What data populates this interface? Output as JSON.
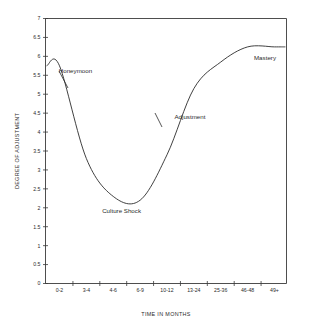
{
  "chart_data": {
    "type": "line",
    "title": "",
    "subtitle": "",
    "xlabel": "TIME IN MONTHS",
    "ylabel": "DEGREE OF ADJUSTMENT",
    "categories": [
      "0-2",
      "3-4",
      "4-6",
      "6-9",
      "10-12",
      "13-24",
      "25-36",
      "46-48",
      "49+"
    ],
    "x": [
      0,
      1,
      2,
      3,
      4,
      5,
      6,
      7,
      8
    ],
    "values": [
      5.75,
      3.3,
      2.3,
      2.2,
      3.4,
      5.15,
      5.85,
      6.25,
      6.25
    ],
    "series": [
      {
        "name": "Degree of Adjustment",
        "values": [
          5.75,
          3.3,
          2.3,
          2.2,
          3.4,
          5.15,
          5.85,
          6.25,
          6.25
        ]
      }
    ],
    "ylim": [
      0,
      7
    ],
    "ytick_step": 0.5,
    "yticks": [
      "0",
      "0.5",
      "1",
      "1.5",
      "2",
      "2.5",
      "3",
      "3.5",
      "4",
      "4.5",
      "5",
      "5.5",
      "6",
      "6.5",
      "7"
    ],
    "grid": false,
    "legend": "none",
    "annotations": [
      {
        "text": "Honeymoon",
        "x_frac": 0.055,
        "y_value": 5.55
      },
      {
        "text": "Culture Shock",
        "x_frac": 0.235,
        "y_value": 1.85
      },
      {
        "text": "Adjustment",
        "x_frac": 0.535,
        "y_value": 4.35
      },
      {
        "text": "Mastery",
        "x_frac": 0.865,
        "y_value": 5.9
      }
    ],
    "line_color": "#2b2b2b",
    "axis_color": "#3a3a3a",
    "background_color": "#ffffff"
  }
}
